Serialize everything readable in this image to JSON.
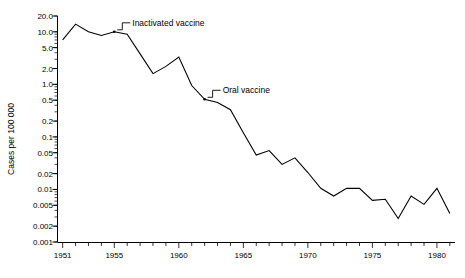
{
  "chart_data": {
    "type": "line",
    "title": "",
    "xlabel": "",
    "ylabel": "Cases per 100 000",
    "yscale": "log",
    "ylim": [
      0.001,
      20.0
    ],
    "xlim": [
      1950.6,
      1981.4
    ],
    "grid": false,
    "legend": null,
    "y_ticks": [
      20.0,
      10.0,
      5.0,
      2.0,
      1.0,
      0.5,
      0.2,
      0.1,
      0.05,
      0.02,
      0.01,
      0.005,
      0.002,
      0.001
    ],
    "y_ticklabels": [
      "20.0",
      "10.0",
      "5.0",
      "2.0",
      "1.0",
      "0.5",
      "0.2",
      "0.1",
      "0.05",
      "0.02",
      "0.01",
      "0.005",
      "0.002",
      "0.001"
    ],
    "x_ticks": [
      1951,
      1952,
      1953,
      1954,
      1955,
      1956,
      1957,
      1958,
      1959,
      1960,
      1961,
      1962,
      1963,
      1964,
      1965,
      1966,
      1967,
      1968,
      1969,
      1970,
      1971,
      1972,
      1973,
      1974,
      1975,
      1976,
      1977,
      1978,
      1979,
      1980,
      1981
    ],
    "x_ticklabels_shown": [
      "1951",
      "1955",
      "1960",
      "1965",
      "1970",
      "1975",
      "1980"
    ],
    "x_ticklabel_values": [
      1951,
      1955,
      1960,
      1965,
      1970,
      1975,
      1980
    ],
    "series": [
      {
        "name": "Cases per 100 000",
        "x": [
          1951,
          1952,
          1953,
          1954,
          1955,
          1956,
          1957,
          1958,
          1959,
          1960,
          1961,
          1962,
          1963,
          1964,
          1965,
          1966,
          1967,
          1968,
          1969,
          1970,
          1971,
          1972,
          1973,
          1974,
          1975,
          1976,
          1977,
          1978,
          1979,
          1980,
          1981
        ],
        "values": [
          7.0,
          14.0,
          10.0,
          8.5,
          10.0,
          9.0,
          3.8,
          1.6,
          2.2,
          3.3,
          0.95,
          0.52,
          0.45,
          0.33,
          0.12,
          0.045,
          0.055,
          0.03,
          0.04,
          0.021,
          0.0105,
          0.0075,
          0.0105,
          0.0105,
          0.0062,
          0.0065,
          0.0028,
          0.0075,
          0.0052,
          0.0105,
          0.0035
        ]
      }
    ],
    "annotations": [
      {
        "label": "Inactivated vaccine",
        "x": 1955,
        "y": 10.0
      },
      {
        "label": "Oral vaccine",
        "x": 1962,
        "y": 0.52
      }
    ]
  },
  "axis": {
    "y_title": "Cases per 100 000"
  }
}
